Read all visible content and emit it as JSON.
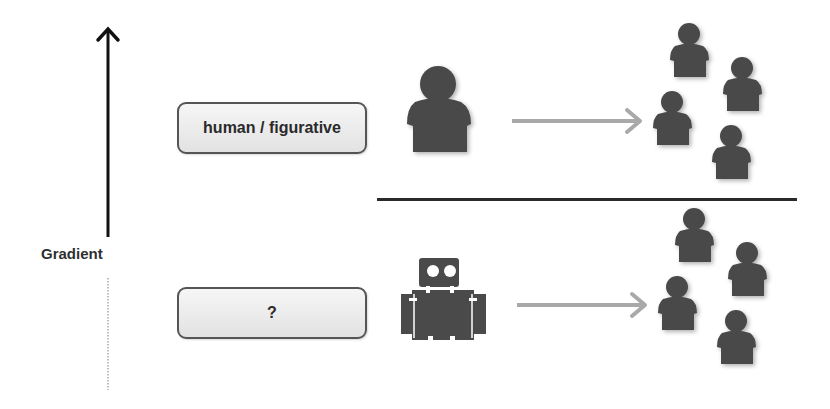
{
  "diagram": {
    "axis": {
      "label": "Gradient",
      "direction": "up",
      "lower_segment": "dotted"
    },
    "rows": [
      {
        "label": "human / figurative",
        "agent_icon": "person-icon",
        "arrow_icon": "arrow-right-icon",
        "audience_icon": "group-of-people-icon",
        "audience_count": 4
      },
      {
        "label": "?",
        "agent_icon": "robot-icon",
        "arrow_icon": "arrow-right-icon",
        "audience_icon": "group-of-people-icon",
        "audience_count": 4
      }
    ],
    "colors": {
      "figure": "#4a4a4a",
      "arrow": "#a9a9a9",
      "axis": "#111111",
      "divider": "#2a2a2a",
      "box_border": "#555555"
    }
  }
}
